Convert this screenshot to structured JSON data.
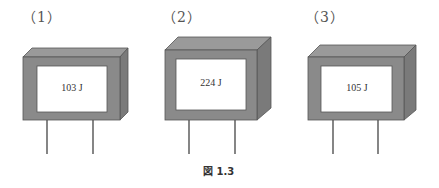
{
  "figure": {
    "caption_prefix": "図",
    "caption_number": "1.3",
    "colors": {
      "body_front": "#8a8a8a",
      "body_top": "#9a9a9a",
      "body_side": "#7a7a7a",
      "label_face": "#ffffff",
      "lead": "#444444"
    },
    "components": [
      {
        "label": "（1）",
        "code": "103 J"
      },
      {
        "label": "（2）",
        "code": "224 J"
      },
      {
        "label": "（3）",
        "code": "105 J"
      }
    ]
  }
}
